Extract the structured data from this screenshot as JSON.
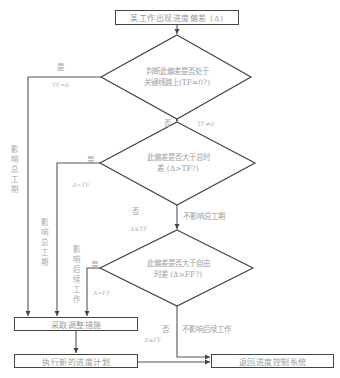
{
  "diagram": {
    "start_box": "某工作出现进度偏差 (Δ)",
    "decision1": {
      "line1": "判断此偏差是否处于",
      "line2": "关键线路上(TF=0?)"
    },
    "decision1_yes": {
      "label": "是",
      "condition": "TF=0"
    },
    "decision1_no": {
      "label": "否",
      "condition": "TF≠0"
    },
    "decision2": {
      "line1": "此偏差是否大于总时",
      "line2": "差 (Δ>TF?)"
    },
    "decision2_yes": {
      "label": "是",
      "condition": "Δ>TF"
    },
    "decision2_no": {
      "label": "否",
      "condition": "Δ≤TF",
      "note": "不影响总工期"
    },
    "decision3": {
      "line1": "此偏差是否大于自由",
      "line2": "时差 (Δ>FF?)"
    },
    "decision3_yes": {
      "label": "是",
      "condition": "Δ>FF"
    },
    "decision3_no": {
      "label": "否",
      "condition": "Δ≤FF",
      "note": "不影响后续工作"
    },
    "side_label_1": "影响总工期",
    "side_label_2": "影响总工期",
    "side_label_3": "影响后续工作",
    "adjust_box": "采取调整措施",
    "execute_box": "执行新的进度计划",
    "return_box": "返回进度控制系统"
  }
}
